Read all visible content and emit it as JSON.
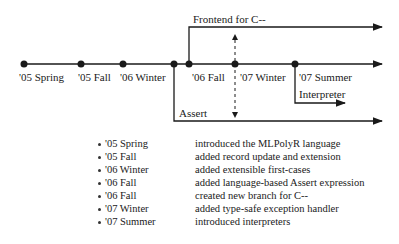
{
  "timeline": {
    "milestones": [
      {
        "label": "'05 Spring"
      },
      {
        "label": "'05 Fall"
      },
      {
        "label": "'06 Winter"
      },
      {
        "label": "'06 Fall"
      },
      {
        "label": "'07 Winter"
      },
      {
        "label": "'07 Summer"
      }
    ],
    "branches": {
      "frontend": "Frontend for C--",
      "assert": "Assert",
      "interpreter": "Interpreter"
    }
  },
  "legend": [
    {
      "date": "'05 Spring",
      "description": "introduced the MLPolyR language"
    },
    {
      "date": "'05 Fall",
      "description": "added record update and extension"
    },
    {
      "date": "'06 Winter",
      "description": "added extensible first-cases"
    },
    {
      "date": "'06 Fall",
      "description": "added language-based Assert expression"
    },
    {
      "date": "'06 Fall",
      "description": "created new branch for C--"
    },
    {
      "date": "'07 Winter",
      "description": "added type-safe exception handler"
    },
    {
      "date": "'07 Summer",
      "description": "introduced interpreters"
    }
  ]
}
